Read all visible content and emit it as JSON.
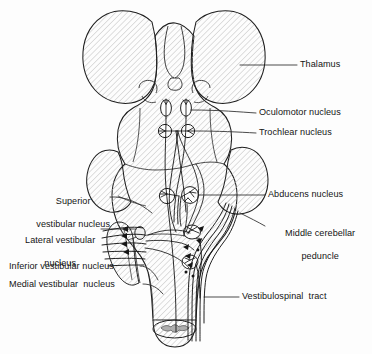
{
  "figure": {
    "view": "dorsal (posterior) view of brainstem and thalamus",
    "background_color": "#fdfdfd",
    "outline_color": "#1a1a1a",
    "hatch_color": "#b9b9b9",
    "leader_color": "#2a2a2a",
    "text_color": "#141414",
    "gray_matter_color": "#b0b0b0"
  },
  "labels": {
    "thalamus": "Thalamus",
    "oculomotor_nucleus": "Oculomotor nucleus",
    "trochlear_nucleus": "Trochlear nucleus",
    "abducens_nucleus": "Abducens nucleus",
    "middle_cerebellar_peduncle_line1": "Middle cerebellar",
    "middle_cerebellar_peduncle_line2": "peduncle",
    "vestibulospinal_tract": "Vestibulospinal  tract",
    "superior_vestibular_nucleus_line1": "Superior",
    "superior_vestibular_nucleus_line2": "vestibular nucleus",
    "lateral_vestibular_nucleus_line1": "Lateral vestibular",
    "lateral_vestibular_nucleus_line2": "nucleus",
    "inferior_vestibular_nucleus": "Inferior vestibular nucleus",
    "medial_vestibular_nucleus": "Medial vestibular  nucleus"
  },
  "structures": [
    {
      "name": "thalamus",
      "side": "bilateral",
      "shading": "hatched"
    },
    {
      "name": "oculomotor-nucleus",
      "side": "bilateral",
      "shape": "oval"
    },
    {
      "name": "trochlear-nucleus",
      "side": "bilateral",
      "shape": "circle"
    },
    {
      "name": "abducens-nucleus",
      "side": "bilateral",
      "shape": "circle"
    },
    {
      "name": "middle-cerebellar-peduncle",
      "side": "bilateral",
      "shading": "hatched"
    },
    {
      "name": "vestibular-nuclear-complex",
      "side": "left",
      "shading": "hatched"
    },
    {
      "name": "vestibulospinal-tract",
      "side": "bilateral",
      "shape": "fiber-bundle"
    },
    {
      "name": "medial-longitudinal-fasciculus",
      "side": "bilateral",
      "shape": "fiber-bundle"
    },
    {
      "name": "vestibular-nerve",
      "side": "left",
      "shape": "fiber-bundle-with-arrows"
    },
    {
      "name": "spinal-cord-cross-section",
      "side": "midline",
      "shading": "gray-matter"
    }
  ]
}
